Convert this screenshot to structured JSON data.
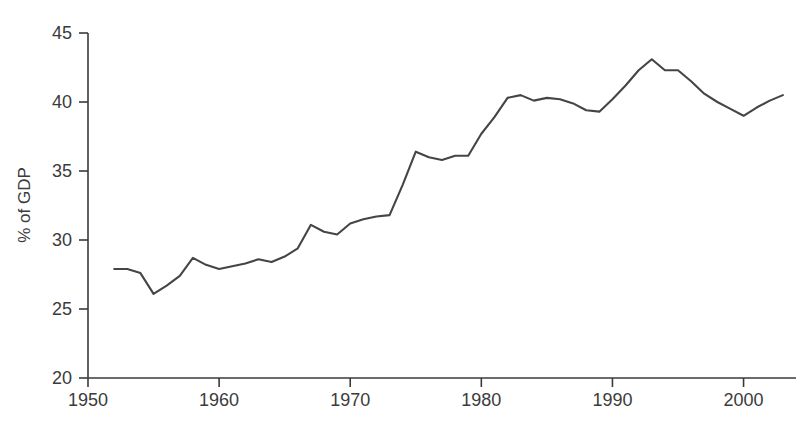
{
  "chart_data": {
    "type": "line",
    "title": "",
    "subtitle": "",
    "xlabel": "",
    "ylabel": "% of GDP",
    "xlim": [
      1950,
      2004
    ],
    "ylim": [
      20,
      45
    ],
    "xticks": [
      1950,
      1960,
      1970,
      1980,
      1990,
      2000
    ],
    "xticklabels": [
      "1950",
      "1960",
      "1970",
      "1980",
      "1990",
      "2000"
    ],
    "yticks": [
      20,
      25,
      30,
      35,
      40,
      45
    ],
    "yticklabels": [
      "20",
      "25",
      "30",
      "35",
      "40",
      "45"
    ],
    "grid": false,
    "legend": false,
    "legend_position": "none",
    "line_color": "#454545",
    "axis_color": "#3a3a3a",
    "text_color": "#3b3b3b",
    "background": "#ffffff",
    "series": [
      {
        "name": "General government expenditure",
        "x": [
          1952,
          1953,
          1954,
          1955,
          1956,
          1957,
          1958,
          1959,
          1960,
          1961,
          1962,
          1963,
          1964,
          1965,
          1966,
          1967,
          1968,
          1969,
          1970,
          1971,
          1972,
          1973,
          1974,
          1975,
          1976,
          1977,
          1978,
          1979,
          1980,
          1981,
          1982,
          1983,
          1984,
          1985,
          1986,
          1987,
          1988,
          1989,
          1990,
          1991,
          1992,
          1993,
          1994,
          1995,
          1996,
          1997,
          1998,
          1999,
          2000,
          2001,
          2002,
          2003
        ],
        "values": [
          27.9,
          27.9,
          27.6,
          26.1,
          26.7,
          27.4,
          28.7,
          28.2,
          27.9,
          28.1,
          28.3,
          28.6,
          28.4,
          28.8,
          29.4,
          31.1,
          30.6,
          30.4,
          31.2,
          31.5,
          31.7,
          31.8,
          34.0,
          36.4,
          36.0,
          35.8,
          36.1,
          36.1,
          37.7,
          38.9,
          40.3,
          40.5,
          40.1,
          40.3,
          40.2,
          39.9,
          39.4,
          39.3,
          40.2,
          41.2,
          42.3,
          43.1,
          42.3,
          42.3,
          41.5,
          40.6,
          40.0,
          39.5,
          39.0,
          39.6,
          40.1,
          40.5
        ]
      }
    ]
  }
}
